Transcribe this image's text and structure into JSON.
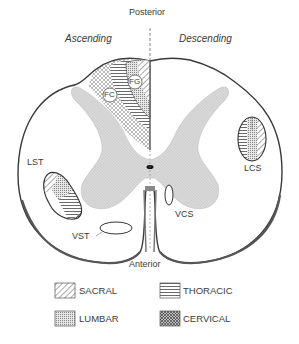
{
  "figure": {
    "orientation": {
      "top": "Posterior",
      "bottom": "Anterior"
    },
    "halves": {
      "left": "Ascending",
      "right": "Descending"
    },
    "tracts": [
      {
        "id": "FG",
        "label": "FG",
        "side": "left",
        "region": "posterior column"
      },
      {
        "id": "FC",
        "label": "FC",
        "side": "left",
        "region": "posterior column"
      },
      {
        "id": "LST",
        "label": "LST",
        "side": "left",
        "region": "lateral"
      },
      {
        "id": "VST",
        "label": "VST",
        "side": "left",
        "region": "anterior"
      },
      {
        "id": "LCS",
        "label": "LCS",
        "side": "right",
        "region": "lateral"
      },
      {
        "id": "VCS",
        "label": "VCS",
        "side": "right",
        "region": "anterior"
      }
    ],
    "legend": [
      {
        "key": "sacral",
        "label": "SACRAL",
        "pattern": "diagonal-hatch"
      },
      {
        "key": "thoracic",
        "label": "THORACIC",
        "pattern": "horizontal-lines"
      },
      {
        "key": "lumbar",
        "label": "LUMBAR",
        "pattern": "fine-dots"
      },
      {
        "key": "cervical",
        "label": "CERVICAL",
        "pattern": "crosshatch"
      }
    ],
    "colors": {
      "outline": "#3a3a3a",
      "gray_matter": "#d4d4d4",
      "background": "#ffffff"
    }
  }
}
